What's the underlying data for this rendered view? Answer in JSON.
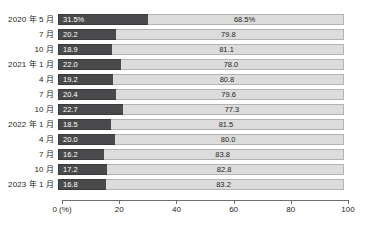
{
  "chart_data": {
    "type": "bar",
    "subtype": "stacked-horizontal-100",
    "title": "",
    "xlabel": "0 (%)",
    "ylabel": "",
    "xlim": [
      0,
      100
    ],
    "grid": false,
    "legend": null,
    "categories": [
      "2020 年 5 月",
      "7 月",
      "10 月",
      "2021 年 1 月",
      "4 月",
      "7 月",
      "10 月",
      "2022 年 1 月",
      "4 月",
      "7 月",
      "10 月",
      "2023 年 1 月"
    ],
    "series": [
      {
        "name": "dark-segment",
        "color": "#4a4a4c",
        "values": [
          31.5,
          20.2,
          18.9,
          22.0,
          19.2,
          20.4,
          22.7,
          18.5,
          20.0,
          16.2,
          17.2,
          16.8
        ],
        "labels": [
          "31.5%",
          "20.2",
          "18.9",
          "22.0",
          "19.2",
          "20.4",
          "22.7",
          "18.5",
          "20.0",
          "16.2",
          "17.2",
          "16.8"
        ]
      },
      {
        "name": "light-segment",
        "color": "#dcdcdc",
        "values": [
          68.5,
          79.8,
          81.1,
          78.0,
          80.8,
          79.6,
          77.3,
          81.5,
          80.0,
          83.8,
          82.8,
          83.2
        ],
        "labels": [
          "68.5%",
          "79.8",
          "81.1",
          "78.0",
          "80.8",
          "79.6",
          "77.3",
          "81.5",
          "80.0",
          "83.8",
          "82.8",
          "83.2"
        ]
      }
    ],
    "xticks": [
      0,
      20,
      40,
      60,
      80,
      100
    ],
    "xtick_labels": [
      "0 (%)",
      "20",
      "40",
      "60",
      "80",
      "100"
    ]
  },
  "colors": {
    "dark": "#4a4a4c",
    "dark_border": "#3a3a3c",
    "light": "#dcdcdc",
    "light_border": "#b4b4b4",
    "text": "#231f20",
    "axis": "#6d6e70",
    "background": "#ffffff"
  }
}
